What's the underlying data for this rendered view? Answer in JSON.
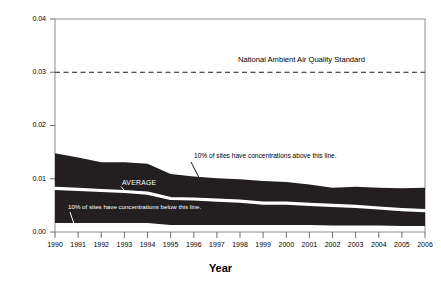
{
  "chart_data": {
    "type": "area",
    "title": "",
    "xlabel": "Year",
    "ylabel": "SO2 Ambient Concentration, ppm",
    "ylabel_prefix": "SO",
    "ylabel_sub": "2",
    "ylabel_suffix": " Ambient Concentration, ppm",
    "xlim": [
      1990,
      2006
    ],
    "ylim": [
      0.0,
      0.04
    ],
    "grid": false,
    "legend_position": "none",
    "x": [
      1990,
      1991,
      1992,
      1993,
      1994,
      1995,
      1996,
      1997,
      1998,
      1999,
      2000,
      2001,
      2002,
      2003,
      2004,
      2005,
      2006
    ],
    "ytick_labels": [
      "0.04",
      "0.03",
      "0.02",
      "0.01",
      "0.00"
    ],
    "ytick_values": [
      0.04,
      0.03,
      0.02,
      0.01,
      0.0
    ],
    "xtick_labels": [
      "1990",
      "1991",
      "1992",
      "1993",
      "1994",
      "1995",
      "1996",
      "1997",
      "1998",
      "1999",
      "2000",
      "2001",
      "2002",
      "2003",
      "2004",
      "2005",
      "2006"
    ],
    "series": [
      {
        "name": "90th percentile",
        "label": "10% of sites have concentrations above this line.",
        "values": [
          0.0148,
          0.014,
          0.0131,
          0.0131,
          0.0128,
          0.0109,
          0.0104,
          0.0101,
          0.0099,
          0.0096,
          0.0094,
          0.0089,
          0.0083,
          0.0085,
          0.0083,
          0.0082,
          0.0083
        ]
      },
      {
        "name": "Average",
        "label": "AVERAGE",
        "values": [
          0.0082,
          0.008,
          0.0078,
          0.0076,
          0.0073,
          0.0063,
          0.0062,
          0.006,
          0.0058,
          0.0054,
          0.0054,
          0.0052,
          0.005,
          0.0048,
          0.0045,
          0.0042,
          0.004
        ]
      },
      {
        "name": "10th percentile",
        "label": "10% of sites have concentrations below this line.",
        "values": [
          0.0017,
          0.0017,
          0.0017,
          0.0017,
          0.0017,
          0.0013,
          0.0013,
          0.0013,
          0.0013,
          0.0013,
          0.0013,
          0.0013,
          0.0012,
          0.0012,
          0.0012,
          0.0011,
          0.0011
        ]
      }
    ],
    "reference_line": {
      "label": "National Ambient Air Quality Standard",
      "value": 0.03,
      "style": "dashed"
    },
    "colors": {
      "band": "#231f20",
      "average_line": "#ffffff",
      "axis": "#808080",
      "text": "#000000",
      "background": "#ffffff"
    }
  },
  "annotations": {
    "naaqs": "National Ambient Air Quality Standard",
    "upper": "10% of sites have concentrations above this line.",
    "lower": "10% of sites have concentrations below this line.",
    "average": "AVERAGE"
  }
}
